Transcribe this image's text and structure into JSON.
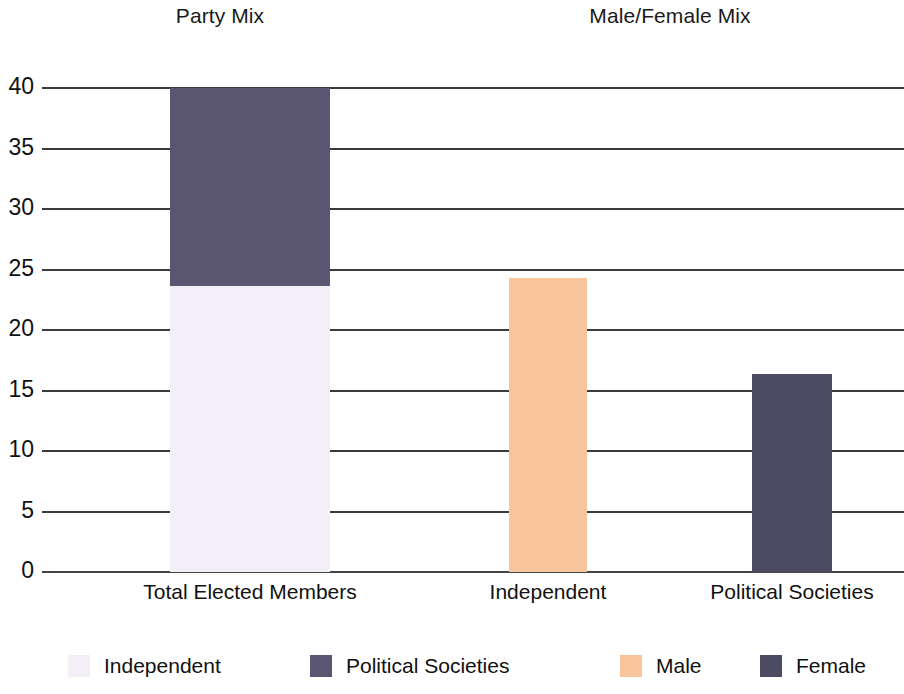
{
  "panels": [
    {
      "title": "Party Mix"
    },
    {
      "title": "Male/Female Mix"
    }
  ],
  "colors": {
    "independent": "#f4eff7",
    "political_societies": "#5a5570",
    "male": "#f7c49b",
    "female": "#4d4a63",
    "gridline": "#3b3b3b",
    "text": "#111111",
    "background": "#ffffff"
  },
  "legend": [
    {
      "label": "Independent",
      "color_key": "independent"
    },
    {
      "label": "Political Societies",
      "color_key": "political_societies"
    },
    {
      "label": "Male",
      "color_key": "male"
    },
    {
      "label": "Female",
      "color_key": "female"
    }
  ],
  "axis": {
    "y_ticks": [
      "40",
      "35",
      "30",
      "25",
      "20",
      "15",
      "10",
      "5",
      "0"
    ],
    "x_labels": [
      "Total Elected Members",
      "Independent",
      "Political Societies"
    ]
  },
  "chart_data": {
    "type": "bar",
    "subtitle": "",
    "xlabel": "",
    "ylabel": "",
    "ylim": [
      0,
      40
    ],
    "ytick_step": 5,
    "grid": true,
    "stacked": true,
    "legend_position": "bottom",
    "panels": [
      {
        "title": "Party Mix",
        "categories": [
          "Total Elected Members"
        ],
        "series": [
          {
            "name": "Independent",
            "values": [
              23.6
            ],
            "color": "#f4eff7"
          },
          {
            "name": "Political Societies",
            "values": [
              16.4
            ],
            "color": "#5a5570"
          }
        ]
      },
      {
        "title": "Male/Female Mix",
        "categories": [
          "Independent",
          "Political Societies"
        ],
        "series": [
          {
            "name": "Male",
            "values": [
              24.3,
              0
            ],
            "color": "#f7c49b"
          },
          {
            "name": "Female",
            "values": [
              0,
              16.4
            ],
            "color": "#4d4a63"
          }
        ]
      }
    ],
    "bars": [
      {
        "category": "Total Elected Members",
        "total": 40.0,
        "segments": [
          {
            "name": "Political Societies",
            "value": 16.4,
            "from": 23.6,
            "to": 40.0
          },
          {
            "name": "Independent",
            "value": 23.6,
            "from": 0,
            "to": 23.6
          }
        ]
      },
      {
        "category": "Independent",
        "total": 24.3,
        "segments": [
          {
            "name": "Male",
            "value": 24.3,
            "from": 0,
            "to": 24.3
          }
        ]
      },
      {
        "category": "Political Societies",
        "total": 16.4,
        "segments": [
          {
            "name": "Female",
            "value": 16.4,
            "from": 0,
            "to": 16.4
          }
        ]
      }
    ]
  }
}
